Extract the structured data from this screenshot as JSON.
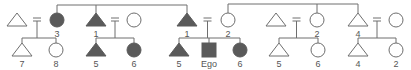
{
  "diagram": {
    "type": "kinship-chart",
    "colors": {
      "line": "#6e6e6e",
      "filled": "#5a5a5a",
      "open": "#ffffff",
      "label": "#555555"
    },
    "sibling_lines": [
      {
        "y": 5,
        "x1": 57,
        "x2": 187,
        "drops": [
          57,
          96,
          187
        ]
      },
      {
        "y": 4,
        "x1": 228,
        "x2": 358,
        "drops": [
          228,
          317,
          358
        ]
      }
    ],
    "couples": [
      {
        "husband": {
          "shape": "triangle",
          "filled": false,
          "x": 17,
          "label": ""
        },
        "wife": {
          "shape": "circle",
          "filled": true,
          "x": 57,
          "label": "3"
        },
        "children": [
          {
            "shape": "triangle",
            "filled": false,
            "x": 22,
            "label": "7"
          },
          {
            "shape": "circle",
            "filled": false,
            "x": 56,
            "label": "8"
          }
        ]
      },
      {
        "husband": {
          "shape": "triangle",
          "filled": true,
          "x": 96,
          "label": "1"
        },
        "wife": {
          "shape": "circle",
          "filled": false,
          "x": 134,
          "label": ""
        },
        "children": [
          {
            "shape": "triangle",
            "filled": true,
            "x": 96,
            "label": "5"
          },
          {
            "shape": "circle",
            "filled": true,
            "x": 134,
            "label": "6"
          }
        ]
      },
      {
        "husband": {
          "shape": "triangle",
          "filled": true,
          "x": 187,
          "label": "1"
        },
        "wife": {
          "shape": "circle",
          "filled": false,
          "x": 228,
          "label": "2"
        },
        "children": [
          {
            "shape": "triangle",
            "filled": true,
            "x": 179,
            "label": "5"
          },
          {
            "shape": "square",
            "filled": true,
            "x": 209,
            "label": "Ego"
          },
          {
            "shape": "circle",
            "filled": true,
            "x": 240,
            "label": "6"
          }
        ]
      },
      {
        "husband": {
          "shape": "triangle",
          "filled": false,
          "x": 276,
          "label": ""
        },
        "wife": {
          "shape": "circle",
          "filled": false,
          "x": 317,
          "label": "2"
        },
        "children": [
          {
            "shape": "triangle",
            "filled": false,
            "x": 279,
            "label": "5"
          },
          {
            "shape": "circle",
            "filled": false,
            "x": 318,
            "label": "6"
          }
        ]
      },
      {
        "husband": {
          "shape": "triangle",
          "filled": false,
          "x": 358,
          "label": "4"
        },
        "wife": {
          "shape": "circle",
          "filled": false,
          "x": 396,
          "label": ""
        },
        "children": [
          {
            "shape": "triangle",
            "filled": false,
            "x": 358,
            "label": "4"
          },
          {
            "shape": "circle",
            "filled": false,
            "x": 396,
            "label": "2"
          }
        ]
      }
    ]
  }
}
